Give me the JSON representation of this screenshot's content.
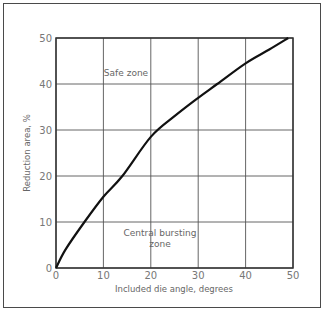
{
  "chart_data": {
    "type": "line",
    "title": "",
    "xlabel": "Included die angle, degrees",
    "ylabel": "Reduction area, %",
    "xlim": [
      0,
      50
    ],
    "ylim": [
      0,
      50
    ],
    "xticks": [
      0,
      10,
      20,
      30,
      40,
      50
    ],
    "yticks": [
      0,
      10,
      20,
      30,
      40,
      50
    ],
    "grid": true,
    "legend": null,
    "series": [
      {
        "name": "Boundary curve",
        "x": [
          0,
          2,
          6,
          10,
          14,
          20,
          25,
          30,
          34,
          40,
          45,
          49
        ],
        "y": [
          0,
          4,
          10,
          15.5,
          20,
          28.5,
          33,
          37,
          40,
          44.5,
          47.5,
          50
        ]
      }
    ],
    "annotations": [
      {
        "text": "Safe zone",
        "x": 15,
        "y": 42
      },
      {
        "text": "Central bursting",
        "x": 22,
        "y": 8
      },
      {
        "text": "zone",
        "x": 22,
        "y": 5
      }
    ]
  },
  "labels": {
    "xlabel": "Included die angle, degrees",
    "ylabel": "Reduction area, %",
    "safe": "Safe zone",
    "burst1": "Central bursting",
    "burst2": "zone",
    "xt": [
      "0",
      "10",
      "20",
      "30",
      "40",
      "50"
    ],
    "yt": [
      "0",
      "10",
      "20",
      "30",
      "40",
      "50"
    ]
  }
}
